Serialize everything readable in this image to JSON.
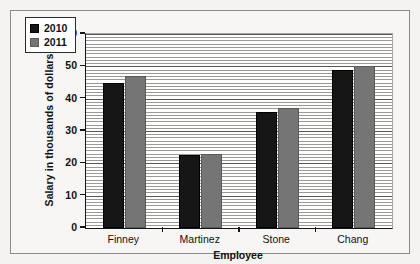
{
  "problem": {
    "number": "29."
  },
  "chart_data": {
    "type": "bar",
    "title": "",
    "xlabel": "Employee",
    "ylabel": "Salary in thousands of dollars",
    "categories": [
      "Finney",
      "Martinez",
      "Stone",
      "Chang"
    ],
    "series": [
      {
        "name": "2010",
        "color": "#161616",
        "values": [
          45,
          22.5,
          36,
          49
        ]
      },
      {
        "name": "2011",
        "color": "#757575",
        "values": [
          47,
          23,
          37,
          50
        ]
      }
    ],
    "ylim": [
      0,
      60
    ],
    "ytick_labels": [
      "0",
      "10",
      "20",
      "30",
      "40",
      "50",
      "60"
    ],
    "ytick_values": [
      0,
      10,
      20,
      30,
      40,
      50,
      60
    ],
    "ytick_step": 10,
    "minor_gridline_step": 1,
    "grid": true,
    "legend_position": "top-left",
    "legend_entries": [
      "2010",
      "2011"
    ]
  }
}
